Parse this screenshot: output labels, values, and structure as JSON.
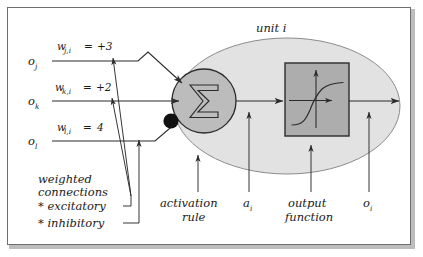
{
  "figure": {
    "title": "unit i",
    "frame": {
      "border_color": "#6e6e6e",
      "shadow_color": "#bdbdbd",
      "background": "#ffffff"
    }
  },
  "colors": {
    "unit_body_fill": "#e2e2e2",
    "sum_circle_fill": "#bcbcbc",
    "output_box_fill": "#adadad",
    "stroke": "#2b2b2b",
    "inhibitory_dot": "#111111",
    "text": "#1a1a1a"
  },
  "inputs": [
    {
      "id": "oj",
      "label": "o",
      "subscript": "j",
      "weight_symbol": "w",
      "weight_subscript": "j,i",
      "weight_equals": "=",
      "weight_value": "+3",
      "kind": "excitatory"
    },
    {
      "id": "ok",
      "label": "o",
      "subscript": "k",
      "weight_symbol": "w",
      "weight_subscript": "k,i",
      "weight_equals": "=",
      "weight_value": "+2",
      "kind": "excitatory"
    },
    {
      "id": "ol",
      "label": "o",
      "subscript": "l",
      "weight_symbol": "w",
      "weight_subscript": "l,i",
      "weight_equals": "=",
      "weight_value": "4",
      "kind": "inhibitory"
    }
  ],
  "legend": {
    "line1": "weighted",
    "line2": "connections",
    "line3": "* excitatory",
    "line4": "* inhibitory"
  },
  "callouts": {
    "activation_rule_line1": "activation",
    "activation_rule_line2": "rule",
    "activation_value": "a",
    "activation_value_sub": "i",
    "output_function_line1": "output",
    "output_function_line2": "function",
    "output_value": "o",
    "output_value_sub": "i"
  },
  "glyphs": {
    "summation": "summation-sigma-symbol",
    "transfer_curve": "sigmoid-curve-symbol"
  }
}
